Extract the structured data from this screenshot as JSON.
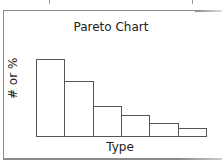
{
  "chart_data": {
    "type": "bar",
    "title": "Pareto Chart",
    "xlabel": "Type",
    "ylabel": "# or %",
    "categories": [
      "1",
      "2",
      "3",
      "4",
      "5",
      "6"
    ],
    "values": [
      78,
      56,
      31,
      22,
      14,
      9
    ],
    "ylim": [
      0,
      87
    ],
    "grid": false,
    "legend": null,
    "tick_labels_shown": false,
    "sorted_descending": true,
    "bar_fill": "#ffffff",
    "bar_stroke": "#555555"
  }
}
